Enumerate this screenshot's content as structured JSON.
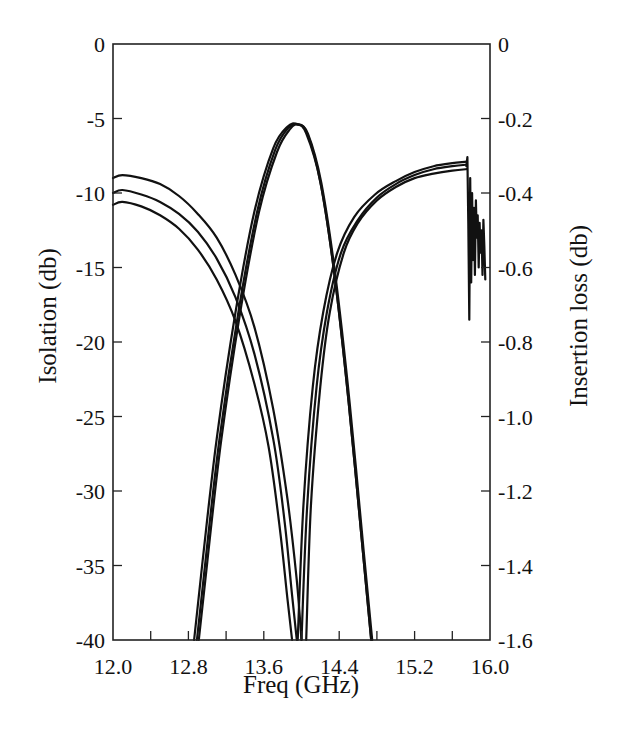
{
  "chart_data": {
    "type": "line",
    "title": "",
    "xlabel": "Freq (GHz)",
    "ylabel": "Isolation (db)",
    "y2label": "Insertion loss (db)",
    "xlim": [
      12.0,
      16.0
    ],
    "ylim": [
      -40,
      0
    ],
    "y2lim": [
      -1.6,
      0
    ],
    "grid": false,
    "legend": "none",
    "x_ticks": [
      "12.0",
      "12.8",
      "13.6",
      "14.4",
      "15.2",
      "16.0"
    ],
    "x_tick_values": [
      12.0,
      12.4,
      12.8,
      13.2,
      13.6,
      14.0,
      14.4,
      14.8,
      15.2,
      15.6,
      16.0
    ],
    "y_ticks": [
      "0",
      "-5",
      "-10",
      "-15",
      "-20",
      "-25",
      "-30",
      "-35",
      "-40"
    ],
    "y2_ticks": [
      "0",
      "-0.2",
      "-0.4",
      "-0.6",
      "-0.8",
      "-1.0",
      "-1.2",
      "-1.4",
      "-1.6"
    ],
    "series": [
      {
        "name": "Isolation (low band) 1",
        "axis": "left",
        "x": [
          12.0,
          12.1,
          12.3,
          12.5,
          12.7,
          12.9,
          13.1,
          13.3,
          13.5,
          13.7,
          13.85,
          13.95,
          14.0
        ],
        "y": [
          -9.0,
          -8.8,
          -9.0,
          -9.4,
          -10.2,
          -11.4,
          -13.0,
          -15.5,
          -19.0,
          -24.5,
          -30.5,
          -36.0,
          -40.0
        ]
      },
      {
        "name": "Isolation (low band) 2",
        "axis": "left",
        "x": [
          12.0,
          12.1,
          12.3,
          12.5,
          12.7,
          12.9,
          13.1,
          13.3,
          13.5,
          13.7,
          13.82,
          13.9,
          13.95
        ],
        "y": [
          -10.0,
          -9.8,
          -10.1,
          -10.6,
          -11.4,
          -12.6,
          -14.4,
          -17.0,
          -20.8,
          -26.5,
          -32.0,
          -37.0,
          -40.0
        ]
      },
      {
        "name": "Isolation (low band) 3",
        "axis": "left",
        "x": [
          12.0,
          12.1,
          12.3,
          12.5,
          12.7,
          12.9,
          13.1,
          13.3,
          13.5,
          13.65,
          13.77,
          13.85,
          13.9
        ],
        "y": [
          -10.8,
          -10.6,
          -10.9,
          -11.5,
          -12.4,
          -13.8,
          -15.8,
          -18.6,
          -22.8,
          -27.0,
          -32.5,
          -37.2,
          -40.0
        ]
      },
      {
        "name": "Isolation (high band) 1",
        "axis": "left",
        "x": [
          14.05,
          14.1,
          14.2,
          14.3,
          14.45,
          14.6,
          14.8,
          15.0,
          15.2,
          15.4,
          15.6,
          15.75
        ],
        "y": [
          -40.0,
          -31.0,
          -23.0,
          -18.0,
          -14.0,
          -12.0,
          -10.5,
          -9.6,
          -9.0,
          -8.7,
          -8.5,
          -8.4
        ]
      },
      {
        "name": "Isolation (high band) 2",
        "axis": "left",
        "x": [
          14.0,
          14.06,
          14.16,
          14.27,
          14.42,
          14.6,
          14.8,
          15.0,
          15.2,
          15.4,
          15.6,
          15.75
        ],
        "y": [
          -40.0,
          -31.0,
          -23.0,
          -18.0,
          -14.0,
          -11.8,
          -10.3,
          -9.4,
          -8.8,
          -8.4,
          -8.2,
          -8.1
        ]
      },
      {
        "name": "Isolation (high band) 3",
        "axis": "left",
        "x": [
          13.96,
          14.02,
          14.12,
          14.23,
          14.38,
          14.56,
          14.78,
          15.0,
          15.2,
          15.4,
          15.6,
          15.75
        ],
        "y": [
          -40.0,
          -31.0,
          -23.0,
          -18.0,
          -14.0,
          -11.6,
          -10.1,
          -9.2,
          -8.6,
          -8.2,
          -8.0,
          -7.9
        ]
      },
      {
        "name": "Isolation ripple (>15.75 GHz)",
        "axis": "left",
        "x": [
          15.75,
          15.76,
          15.77,
          15.78,
          15.79,
          15.8,
          15.81,
          15.82,
          15.83,
          15.84,
          15.85,
          15.86,
          15.87,
          15.88,
          15.89,
          15.9,
          15.91,
          15.92,
          15.93,
          15.94,
          15.95
        ],
        "y": [
          -8.2,
          -7.6,
          -12.0,
          -18.5,
          -9.0,
          -16.0,
          -10.0,
          -14.5,
          -11.0,
          -15.5,
          -10.5,
          -13.0,
          -11.5,
          -15.0,
          -12.0,
          -14.0,
          -12.5,
          -15.5,
          -11.8,
          -13.5,
          -15.8
        ]
      },
      {
        "name": "Insertion loss 1",
        "axis": "right",
        "x": [
          12.86,
          12.95,
          13.1,
          13.3,
          13.5,
          13.7,
          13.85,
          13.95,
          14.05,
          14.2,
          14.35,
          14.5,
          14.65,
          14.74
        ],
        "y": [
          -1.6,
          -1.39,
          -1.06,
          -0.72,
          -0.45,
          -0.28,
          -0.222,
          -0.215,
          -0.24,
          -0.37,
          -0.62,
          -0.96,
          -1.36,
          -1.6
        ]
      },
      {
        "name": "Insertion loss 2",
        "axis": "right",
        "x": [
          12.89,
          12.98,
          13.13,
          13.33,
          13.53,
          13.72,
          13.86,
          13.96,
          14.06,
          14.2,
          14.35,
          14.5,
          14.65,
          14.74
        ],
        "y": [
          -1.6,
          -1.39,
          -1.06,
          -0.72,
          -0.45,
          -0.285,
          -0.225,
          -0.215,
          -0.24,
          -0.37,
          -0.62,
          -0.96,
          -1.36,
          -1.6
        ]
      },
      {
        "name": "Insertion loss 3",
        "axis": "right",
        "x": [
          12.91,
          13.0,
          13.15,
          13.35,
          13.55,
          13.74,
          13.88,
          13.97,
          14.07,
          14.21,
          14.36,
          14.51,
          14.66,
          14.75
        ],
        "y": [
          -1.6,
          -1.39,
          -1.06,
          -0.72,
          -0.45,
          -0.29,
          -0.228,
          -0.217,
          -0.242,
          -0.372,
          -0.622,
          -0.962,
          -1.362,
          -1.6
        ]
      }
    ]
  },
  "labels": {
    "x_title": "Freq (GHz)",
    "y_title": "Isolation (db)",
    "y2_title": "Insertion loss (db)"
  }
}
